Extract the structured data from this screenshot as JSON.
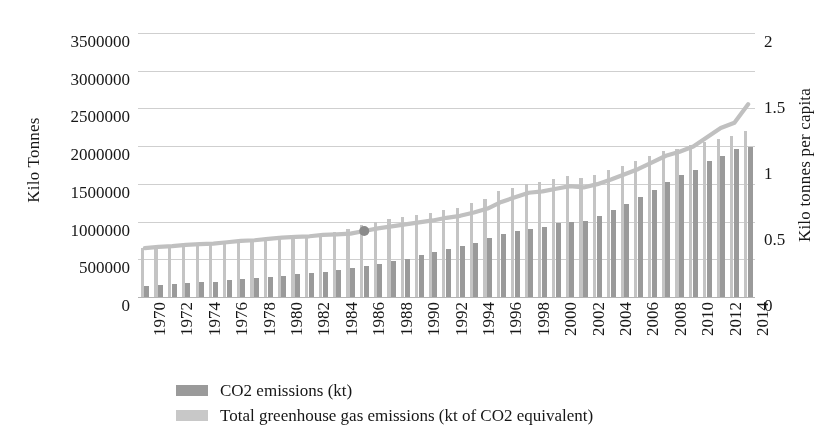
{
  "axes": {
    "y_left_title": "Kilo Tonnes",
    "y_right_title": "Kilo tonnes per capita",
    "y_left_ticks": [
      "0",
      "500000",
      "1000000",
      "1500000",
      "2000000",
      "2500000",
      "3000000",
      "3500000"
    ],
    "y_right_ticks": [
      "0",
      "0.5",
      "1",
      "1.5",
      "2"
    ]
  },
  "legend": {
    "items": [
      {
        "label": "CO2 emissions (kt)",
        "swatch": "co2",
        "color": "#9a9a9a"
      },
      {
        "label": "Total greenhouse gas emissions (kt of CO2 equivalent)",
        "swatch": "ghg",
        "color": "#c8c8c8"
      }
    ]
  },
  "chart_data": {
    "type": "bar",
    "title": "",
    "xlabel": "",
    "ylabel": "Kilo Tonnes",
    "y2label": "Kilo tonnes per capita",
    "ylim": [
      0,
      3500000
    ],
    "y2lim": [
      0,
      2
    ],
    "ytick_step": 500000,
    "y2tick_step": 0.5,
    "grid": true,
    "legend_position": "bottom-left",
    "xtick_label_interval": 2,
    "x": [
      1970,
      1971,
      1972,
      1973,
      1974,
      1975,
      1976,
      1977,
      1978,
      1979,
      1980,
      1981,
      1982,
      1983,
      1984,
      1985,
      1986,
      1987,
      1988,
      1989,
      1990,
      1991,
      1992,
      1993,
      1994,
      1995,
      1996,
      1997,
      1998,
      1999,
      2000,
      2001,
      2002,
      2003,
      2004,
      2005,
      2006,
      2007,
      2008,
      2009,
      2010,
      2011,
      2012,
      2013,
      2014
    ],
    "xticklabels": [
      "1970",
      "1972",
      "1974",
      "1976",
      "1978",
      "1980",
      "1982",
      "1984",
      "1986",
      "1988",
      "1990",
      "1992",
      "1994",
      "1996",
      "1998",
      "2000",
      "2002",
      "2004",
      "2006",
      "2008",
      "2010",
      "2012",
      "2014"
    ],
    "series": [
      {
        "name": "Total greenhouse gas emissions (kt of CO2 equivalent)",
        "kind": "bar",
        "axis": "left",
        "color": "#c4c4c4",
        "values": [
          650000,
          660000,
          670000,
          690000,
          700000,
          705000,
          720000,
          735000,
          745000,
          760000,
          775000,
          790000,
          800000,
          820000,
          860000,
          900000,
          960000,
          1000000,
          1030000,
          1060000,
          1090000,
          1120000,
          1150000,
          1180000,
          1240000,
          1300000,
          1400000,
          1450000,
          1500000,
          1520000,
          1560000,
          1600000,
          1580000,
          1620000,
          1680000,
          1740000,
          1800000,
          1870000,
          1930000,
          1960000,
          2010000,
          2060000,
          2100000,
          2130000,
          2200000
        ]
      },
      {
        "name": "CO2 emissions (kt)",
        "kind": "bar",
        "axis": "left",
        "color": "#9a9a9a",
        "values": [
          150000,
          160000,
          170000,
          185000,
          195000,
          205000,
          220000,
          235000,
          250000,
          265000,
          285000,
          300000,
          315000,
          330000,
          355000,
          380000,
          410000,
          440000,
          475000,
          510000,
          560000,
          600000,
          640000,
          680000,
          720000,
          780000,
          840000,
          880000,
          900000,
          930000,
          980000,
          990000,
          1010000,
          1070000,
          1160000,
          1230000,
          1320000,
          1420000,
          1520000,
          1620000,
          1690000,
          1800000,
          1870000,
          1960000,
          1990000
        ]
      },
      {
        "name": "Kilo tonnes per capita",
        "kind": "line",
        "axis": "right",
        "color": "#c0c0c0",
        "values": [
          0.37,
          0.38,
          0.385,
          0.395,
          0.4,
          0.405,
          0.415,
          0.425,
          0.43,
          0.44,
          0.45,
          0.455,
          0.46,
          0.47,
          0.475,
          0.48,
          0.5,
          0.52,
          0.535,
          0.55,
          0.565,
          0.58,
          0.6,
          0.615,
          0.64,
          0.67,
          0.72,
          0.755,
          0.79,
          0.8,
          0.82,
          0.84,
          0.83,
          0.855,
          0.89,
          0.93,
          0.97,
          1.02,
          1.07,
          1.1,
          1.14,
          1.21,
          1.28,
          1.32,
          1.46
        ]
      }
    ]
  }
}
